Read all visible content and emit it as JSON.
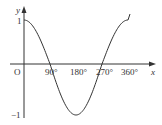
{
  "chart_data": {
    "type": "line",
    "title": "",
    "function": "y = cos x",
    "xlabel": "x",
    "ylabel": "y",
    "origin_label": "O",
    "x_ticks": [
      "90°",
      "180°",
      "270°",
      "360°"
    ],
    "x_tick_values": [
      90,
      180,
      270,
      360
    ],
    "y_ticks": [
      "1",
      "−1"
    ],
    "y_tick_values": [
      1,
      -1
    ],
    "xlim": [
      0,
      360
    ],
    "ylim": [
      -1,
      1
    ],
    "grid": false,
    "legend": null,
    "series": [
      {
        "name": "cos x",
        "x": [
          0,
          45,
          90,
          135,
          180,
          225,
          270,
          315,
          360
        ],
        "y": [
          1,
          0.707,
          0,
          -0.707,
          -1,
          -0.707,
          0,
          0.707,
          1
        ]
      }
    ]
  },
  "colors": {
    "axis": "#333333",
    "curve": "#333333",
    "background": "#ffffff"
  }
}
